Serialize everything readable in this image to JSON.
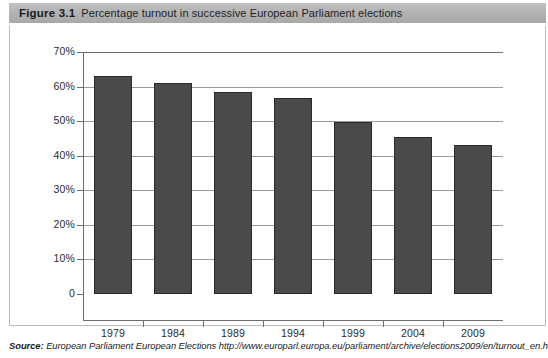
{
  "figure": {
    "number": "Figure 3.1",
    "caption": "Percentage turnout in successive European Parliament elections"
  },
  "source": {
    "label": "Source:",
    "text": "European Parliament European Elections http://www.europarl.europa.eu/parliament/archive/elections2009/en/turnout_en.html"
  },
  "chart_data": {
    "type": "bar",
    "title": "Percentage turnout in successive European Parliament elections",
    "xlabel": "",
    "ylabel": "",
    "categories": [
      "1979",
      "1984",
      "1989",
      "1994",
      "1999",
      "2004",
      "2009"
    ],
    "values": [
      63.0,
      61.0,
      58.5,
      56.8,
      49.8,
      45.5,
      43.0
    ],
    "ylim": [
      0,
      70
    ],
    "yticks": [
      0,
      10,
      20,
      30,
      40,
      50,
      60,
      70
    ],
    "ytick_labels": [
      "0",
      "10%",
      "20%",
      "30%",
      "40%",
      "50%",
      "60%",
      "70%"
    ],
    "grid": true,
    "grid_axis": "y",
    "legend": false,
    "bar_color": "#4a4a4a",
    "bar_edge_color": "#2a2a2a",
    "gridline_color": "#9a9a9a",
    "axis_color": "#6e6e6e"
  }
}
